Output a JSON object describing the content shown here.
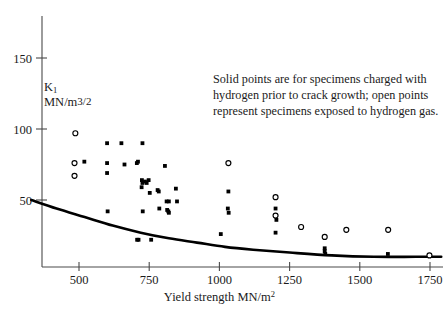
{
  "chart_data": {
    "type": "scatter",
    "title": "",
    "xlabel": "Yield strength MN/m2",
    "ylabel_symbol": "K",
    "ylabel_subscript": "1",
    "ylabel_units": "MN/m",
    "ylabel_units_exponent": "3/2",
    "xlim": [
      330,
      1790
    ],
    "ylim": [
      0,
      178
    ],
    "xticks": [
      500,
      750,
      1000,
      1250,
      1500,
      1750
    ],
    "xticklabels": [
      "500",
      "750",
      "1000",
      "1250",
      "1500",
      "1750"
    ],
    "yticks": [
      50,
      100,
      150
    ],
    "yticklabels": [
      "50",
      "100",
      "150"
    ],
    "grid": false,
    "legend_position": "none",
    "annotation": "Solid points are for specimens charged with hydrogen prior to crack growth; open points represent specimens exposed to hydrogen gas.",
    "annotation_lines": [
      "Solid points are for specimens charged with",
      "hydrogen prior to crack growth; open points",
      "represent specimens exposed to hydrogen gas."
    ],
    "series": [
      {
        "name": "Solid points (hydrogen charged prior to crack growth)",
        "marker": "filled-square",
        "color": "#000000",
        "points": [
          [
            487,
            97
          ],
          [
            519,
            77
          ],
          [
            600,
            90
          ],
          [
            600,
            76
          ],
          [
            600,
            69
          ],
          [
            602,
            42
          ],
          [
            651,
            90
          ],
          [
            662,
            75
          ],
          [
            706,
            76
          ],
          [
            710,
            77
          ],
          [
            707,
            22
          ],
          [
            712,
            22
          ],
          [
            726,
            90
          ],
          [
            724,
            64
          ],
          [
            726,
            62
          ],
          [
            723,
            59
          ],
          [
            727,
            42
          ],
          [
            735,
            63
          ],
          [
            741,
            62
          ],
          [
            748,
            64
          ],
          [
            752,
            55
          ],
          [
            757,
            22
          ],
          [
            780,
            57
          ],
          [
            784,
            56
          ],
          [
            786,
            44
          ],
          [
            806,
            74
          ],
          [
            812,
            49
          ],
          [
            820,
            49
          ],
          [
            814,
            43
          ],
          [
            818,
            42
          ],
          [
            820,
            41
          ],
          [
            845,
            58
          ],
          [
            849,
            49
          ],
          [
            1005,
            26
          ],
          [
            1032,
            56
          ],
          [
            1030,
            44
          ],
          [
            1033,
            41
          ],
          [
            1200,
            44
          ],
          [
            1203,
            36
          ],
          [
            1200,
            27
          ],
          [
            1375,
            16
          ],
          [
            1375,
            14
          ],
          [
            1377,
            12
          ],
          [
            1600,
            12
          ]
        ]
      },
      {
        "name": "Open points (specimens exposed to hydrogen gas)",
        "marker": "open-circle",
        "color": "#000000",
        "points": [
          [
            487,
            97
          ],
          [
            484,
            76
          ],
          [
            484,
            67
          ],
          [
            1032,
            76
          ],
          [
            1200,
            52
          ],
          [
            1200,
            39
          ],
          [
            1291,
            31
          ],
          [
            1375,
            24
          ],
          [
            1452,
            29
          ],
          [
            1601,
            29
          ],
          [
            1748,
            11
          ]
        ]
      }
    ],
    "trend_curve": {
      "name": "threshold curve",
      "color": "#000000",
      "points": [
        [
          330,
          50
        ],
        [
          420,
          44
        ],
        [
          520,
          38
        ],
        [
          620,
          32
        ],
        [
          720,
          27
        ],
        [
          820,
          23
        ],
        [
          920,
          20
        ],
        [
          1020,
          17
        ],
        [
          1120,
          15
        ],
        [
          1250,
          13
        ],
        [
          1400,
          11
        ],
        [
          1550,
          10
        ],
        [
          1700,
          10
        ],
        [
          1790,
          10
        ]
      ]
    }
  }
}
